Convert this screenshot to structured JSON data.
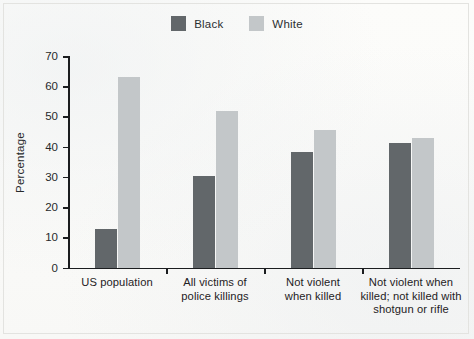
{
  "chart_data": {
    "type": "bar",
    "title": "",
    "xlabel": "",
    "ylabel": "Percentage",
    "ylim": [
      0,
      70
    ],
    "yticks": [
      0,
      10,
      20,
      30,
      40,
      50,
      60,
      70
    ],
    "grid": false,
    "legend_position": "top-center",
    "categories": [
      "US population",
      "All victims of\npolice killings",
      "Not violent\nwhen killed",
      "Not violent when\nkilled; not killed with\nshotgun or rifle"
    ],
    "category_lines": [
      [
        "US population"
      ],
      [
        "All victims of",
        "police killings"
      ],
      [
        "Not violent",
        "when killed"
      ],
      [
        "Not violent when",
        "killed; not killed with",
        "shotgun or rifle"
      ]
    ],
    "series": [
      {
        "name": "Black",
        "color": "#62676a",
        "values": [
          12.6,
          30.4,
          38.3,
          41.2
        ]
      },
      {
        "name": "White",
        "color": "#c3c7c9",
        "values": [
          63.0,
          51.8,
          45.5,
          43.0
        ]
      }
    ]
  },
  "legend": {
    "items": [
      {
        "label": "Black",
        "color": "#62676a"
      },
      {
        "label": "White",
        "color": "#c3c7c9"
      }
    ]
  },
  "axis": {
    "y_title": "Percentage",
    "y_labels": [
      "70",
      "60",
      "50",
      "40",
      "30",
      "20",
      "10",
      "0"
    ]
  }
}
